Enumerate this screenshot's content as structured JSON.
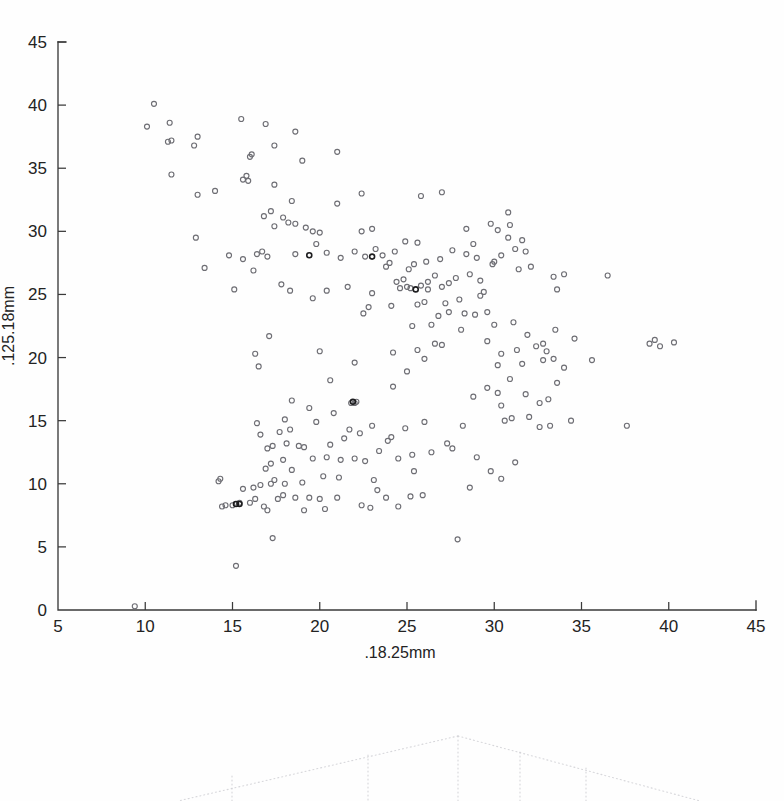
{
  "figure": {
    "kind": "scatter-plot",
    "background_color": "#ffffff",
    "axis_color": "#3a3a3a",
    "marker_color": "#6e6e74"
  },
  "chart_data": {
    "type": "scatter",
    "title": "",
    "subtitle": "",
    "xlabel": ".18.25mm",
    "ylabel": ".125.18mm",
    "xlim": [
      5,
      45
    ],
    "ylim": [
      0,
      45
    ],
    "xticks": [
      5,
      10,
      15,
      20,
      25,
      30,
      35,
      40,
      45
    ],
    "yticks": [
      0,
      5,
      10,
      15,
      20,
      25,
      30,
      35,
      40,
      45
    ],
    "xticklabels": [
      "5",
      "10",
      "15",
      "20",
      "25",
      "30",
      "35",
      "40",
      "45"
    ],
    "yticklabels": [
      "0",
      "5",
      "10",
      "15",
      "20",
      "25",
      "30",
      "35",
      "40",
      "45"
    ],
    "grid": false,
    "legend": null,
    "legend_position": "none",
    "marker": "open-circle",
    "marker_size": 5,
    "n_points": 251,
    "annotations": [],
    "series": [
      {
        "name": "samples",
        "color": "#6e6e74",
        "points": [
          [
            9.4,
            0.3
          ],
          [
            15.2,
            3.5
          ],
          [
            17.3,
            5.7
          ],
          [
            27.9,
            5.6
          ],
          [
            14.4,
            8.2
          ],
          [
            14.6,
            8.3
          ],
          [
            15.0,
            8.3
          ],
          [
            15.2,
            8.4
          ],
          [
            15.4,
            8.5
          ],
          [
            16.0,
            8.5
          ],
          [
            16.3,
            8.8
          ],
          [
            17.0,
            7.9
          ],
          [
            17.6,
            8.8
          ],
          [
            18.6,
            8.9
          ],
          [
            19.4,
            8.9
          ],
          [
            20.0,
            8.8
          ],
          [
            21.0,
            8.9
          ],
          [
            22.4,
            8.3
          ],
          [
            22.9,
            8.1
          ],
          [
            23.8,
            8.9
          ],
          [
            25.2,
            9.0
          ],
          [
            25.9,
            9.1
          ],
          [
            28.6,
            9.7
          ],
          [
            14.2,
            10.2
          ],
          [
            14.3,
            10.4
          ],
          [
            15.6,
            9.6
          ],
          [
            16.2,
            9.7
          ],
          [
            16.6,
            9.9
          ],
          [
            17.2,
            10.0
          ],
          [
            17.4,
            10.3
          ],
          [
            17.9,
            9.1
          ],
          [
            18.0,
            10.0
          ],
          [
            19.0,
            10.1
          ],
          [
            20.2,
            10.6
          ],
          [
            21.1,
            10.5
          ],
          [
            23.1,
            10.3
          ],
          [
            30.4,
            10.4
          ],
          [
            31.2,
            11.7
          ],
          [
            16.9,
            11.2
          ],
          [
            17.2,
            11.6
          ],
          [
            18.4,
            11.1
          ],
          [
            19.6,
            12.0
          ],
          [
            20.4,
            12.1
          ],
          [
            21.2,
            11.9
          ],
          [
            22.6,
            11.8
          ],
          [
            23.4,
            12.6
          ],
          [
            24.5,
            12.0
          ],
          [
            25.3,
            12.3
          ],
          [
            26.4,
            12.5
          ],
          [
            29.0,
            12.1
          ],
          [
            17.0,
            12.8
          ],
          [
            17.3,
            13.0
          ],
          [
            18.1,
            13.2
          ],
          [
            19.1,
            12.9
          ],
          [
            20.6,
            13.1
          ],
          [
            23.9,
            13.4
          ],
          [
            24.1,
            13.7
          ],
          [
            27.3,
            13.2
          ],
          [
            16.6,
            13.9
          ],
          [
            17.7,
            14.1
          ],
          [
            18.3,
            14.3
          ],
          [
            21.7,
            14.3
          ],
          [
            22.3,
            14.0
          ],
          [
            24.9,
            14.4
          ],
          [
            28.2,
            14.6
          ],
          [
            32.6,
            14.5
          ],
          [
            33.2,
            14.6
          ],
          [
            37.6,
            14.6
          ],
          [
            16.4,
            14.8
          ],
          [
            19.8,
            14.9
          ],
          [
            23.0,
            14.6
          ],
          [
            30.6,
            15.0
          ],
          [
            31.0,
            15.2
          ],
          [
            32.0,
            15.3
          ],
          [
            34.4,
            15.0
          ],
          [
            22.0,
            16.4
          ],
          [
            22.1,
            16.5
          ],
          [
            18.4,
            16.6
          ],
          [
            30.4,
            16.2
          ],
          [
            32.6,
            16.4
          ],
          [
            33.1,
            16.7
          ],
          [
            30.2,
            17.2
          ],
          [
            29.6,
            17.6
          ],
          [
            20.6,
            18.2
          ],
          [
            30.9,
            18.3
          ],
          [
            33.6,
            18.0
          ],
          [
            34.0,
            19.2
          ],
          [
            16.5,
            19.3
          ],
          [
            22.0,
            19.6
          ],
          [
            30.2,
            19.4
          ],
          [
            31.6,
            19.5
          ],
          [
            32.8,
            19.8
          ],
          [
            33.4,
            19.9
          ],
          [
            35.6,
            19.8
          ],
          [
            16.3,
            20.3
          ],
          [
            20.0,
            20.5
          ],
          [
            24.2,
            20.4
          ],
          [
            25.6,
            20.6
          ],
          [
            30.4,
            20.3
          ],
          [
            31.3,
            20.6
          ],
          [
            32.4,
            20.9
          ],
          [
            32.8,
            21.1
          ],
          [
            33.0,
            20.5
          ],
          [
            38.9,
            21.1
          ],
          [
            39.2,
            21.4
          ],
          [
            39.5,
            20.9
          ],
          [
            40.3,
            21.2
          ],
          [
            17.1,
            21.7
          ],
          [
            29.6,
            21.3
          ],
          [
            31.9,
            21.8
          ],
          [
            33.5,
            22.2
          ],
          [
            25.3,
            22.5
          ],
          [
            26.4,
            22.6
          ],
          [
            30.0,
            22.6
          ],
          [
            31.1,
            22.8
          ],
          [
            22.5,
            23.5
          ],
          [
            26.8,
            23.3
          ],
          [
            27.4,
            23.6
          ],
          [
            28.3,
            23.5
          ],
          [
            28.9,
            23.4
          ],
          [
            29.6,
            23.6
          ],
          [
            22.8,
            24.0
          ],
          [
            24.1,
            24.1
          ],
          [
            26.0,
            24.4
          ],
          [
            27.2,
            24.3
          ],
          [
            28.0,
            24.6
          ],
          [
            29.2,
            24.9
          ],
          [
            19.6,
            24.7
          ],
          [
            20.4,
            25.3
          ],
          [
            21.6,
            25.6
          ],
          [
            23.0,
            25.1
          ],
          [
            24.6,
            25.5
          ],
          [
            25.0,
            25.6
          ],
          [
            25.2,
            25.5
          ],
          [
            25.8,
            25.7
          ],
          [
            26.2,
            25.4
          ],
          [
            27.0,
            25.6
          ],
          [
            15.1,
            25.4
          ],
          [
            17.8,
            25.8
          ],
          [
            18.3,
            25.3
          ],
          [
            24.4,
            26.0
          ],
          [
            24.8,
            26.2
          ],
          [
            26.6,
            26.5
          ],
          [
            27.8,
            26.3
          ],
          [
            28.6,
            26.6
          ],
          [
            13.4,
            27.1
          ],
          [
            16.2,
            26.9
          ],
          [
            23.8,
            27.2
          ],
          [
            24.0,
            27.5
          ],
          [
            25.1,
            27.0
          ],
          [
            25.4,
            27.4
          ],
          [
            26.1,
            27.6
          ],
          [
            26.9,
            27.8
          ],
          [
            29.0,
            27.9
          ],
          [
            29.9,
            27.4
          ],
          [
            14.8,
            28.1
          ],
          [
            15.6,
            27.8
          ],
          [
            16.4,
            28.2
          ],
          [
            16.7,
            28.4
          ],
          [
            17.0,
            28.0
          ],
          [
            18.6,
            28.2
          ],
          [
            20.4,
            28.3
          ],
          [
            21.2,
            27.9
          ],
          [
            22.0,
            28.4
          ],
          [
            22.6,
            28.0
          ],
          [
            23.2,
            28.6
          ],
          [
            23.6,
            28.1
          ],
          [
            24.3,
            28.4
          ],
          [
            27.6,
            28.5
          ],
          [
            28.4,
            28.2
          ],
          [
            30.4,
            28.1
          ],
          [
            31.2,
            28.6
          ],
          [
            31.8,
            28.4
          ],
          [
            12.9,
            29.5
          ],
          [
            19.8,
            29.0
          ],
          [
            24.9,
            29.2
          ],
          [
            25.6,
            29.1
          ],
          [
            28.8,
            29.0
          ],
          [
            30.8,
            29.5
          ],
          [
            31.6,
            29.3
          ],
          [
            20.0,
            29.9
          ],
          [
            22.4,
            30.0
          ],
          [
            23.0,
            30.2
          ],
          [
            17.4,
            30.4
          ],
          [
            18.2,
            30.7
          ],
          [
            18.6,
            30.6
          ],
          [
            19.2,
            30.3
          ],
          [
            19.6,
            30.0
          ],
          [
            28.4,
            30.2
          ],
          [
            29.8,
            30.6
          ],
          [
            30.2,
            30.1
          ],
          [
            30.9,
            30.5
          ],
          [
            16.8,
            31.2
          ],
          [
            17.2,
            31.6
          ],
          [
            17.9,
            31.1
          ],
          [
            30.8,
            31.5
          ],
          [
            18.4,
            32.4
          ],
          [
            21.0,
            32.2
          ],
          [
            13.0,
            32.9
          ],
          [
            14.0,
            33.2
          ],
          [
            22.4,
            33.0
          ],
          [
            25.8,
            32.8
          ],
          [
            27.0,
            33.1
          ],
          [
            17.4,
            33.7
          ],
          [
            15.6,
            34.1
          ],
          [
            15.8,
            34.4
          ],
          [
            15.9,
            34.0
          ],
          [
            11.5,
            34.5
          ],
          [
            19.0,
            35.6
          ],
          [
            16.0,
            35.9
          ],
          [
            16.1,
            36.1
          ],
          [
            21.0,
            36.3
          ],
          [
            12.8,
            36.8
          ],
          [
            17.4,
            36.8
          ],
          [
            11.3,
            37.1
          ],
          [
            11.5,
            37.2
          ],
          [
            13.0,
            37.5
          ],
          [
            18.6,
            37.9
          ],
          [
            10.1,
            38.3
          ],
          [
            11.4,
            38.6
          ],
          [
            16.9,
            38.5
          ],
          [
            15.5,
            38.9
          ],
          [
            10.5,
            40.1
          ],
          [
            26.2,
            26.0
          ],
          [
            27.4,
            25.9
          ],
          [
            25.6,
            24.2
          ],
          [
            29.4,
            25.2
          ],
          [
            33.6,
            25.4
          ],
          [
            36.5,
            26.5
          ],
          [
            34.0,
            26.6
          ],
          [
            33.4,
            26.4
          ],
          [
            31.4,
            27.0
          ],
          [
            32.1,
            27.2
          ],
          [
            30.0,
            27.6
          ],
          [
            29.2,
            26.1
          ],
          [
            28.1,
            22.2
          ],
          [
            27.0,
            21.0
          ],
          [
            26.6,
            21.1
          ],
          [
            26.0,
            19.9
          ],
          [
            25.0,
            18.9
          ],
          [
            24.2,
            17.7
          ],
          [
            21.8,
            16.4
          ],
          [
            19.4,
            16.0
          ],
          [
            18.0,
            15.1
          ],
          [
            20.8,
            15.6
          ],
          [
            21.4,
            13.6
          ],
          [
            26.0,
            14.9
          ],
          [
            27.6,
            12.8
          ],
          [
            29.8,
            11.0
          ],
          [
            23.3,
            9.5
          ],
          [
            24.5,
            8.2
          ],
          [
            19.1,
            7.9
          ],
          [
            20.3,
            8.0
          ],
          [
            16.8,
            8.2
          ],
          [
            17.9,
            11.9
          ],
          [
            18.8,
            13.0
          ],
          [
            22.0,
            12.0
          ],
          [
            25.4,
            11.0
          ],
          [
            28.8,
            16.9
          ],
          [
            31.8,
            17.1
          ],
          [
            34.6,
            21.5
          ]
        ],
        "dark_points": [
          [
            21.9,
            16.5
          ],
          [
            25.5,
            25.4
          ],
          [
            23.0,
            28.0
          ],
          [
            19.4,
            28.1
          ],
          [
            15.2,
            8.4
          ],
          [
            15.4,
            8.4
          ]
        ]
      }
    ]
  },
  "secondary_figure": {
    "kind": "dendrogram-fragment",
    "description": "faint dotted tree partially visible at page bottom",
    "line_color": "#c9c9cf"
  }
}
